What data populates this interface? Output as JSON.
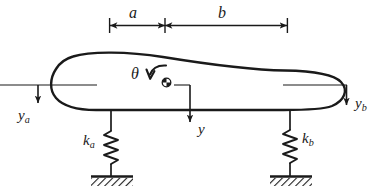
{
  "figure": {
    "background_color": "#ffffff",
    "stroke_color": "#1a1a1a",
    "dimension": {
      "segment_a_label": "a",
      "segment_b_label": "b"
    },
    "labels": {
      "theta": "θ",
      "y_center": "y",
      "y_left_main": "y",
      "y_left_sub": "a",
      "y_right_main": "y",
      "y_right_sub": "b",
      "k_left_main": "k",
      "k_left_sub": "a",
      "k_right_main": "k",
      "k_right_sub": "b"
    },
    "icons": {
      "center_of_mass": "center-of-mass-icon",
      "rotation_arrow": "theta-rotation-arrow-icon",
      "spring_left": "coil-spring-icon",
      "spring_right": "coil-spring-icon",
      "ground_left": "hatched-ground-icon",
      "ground_right": "hatched-ground-icon"
    }
  }
}
